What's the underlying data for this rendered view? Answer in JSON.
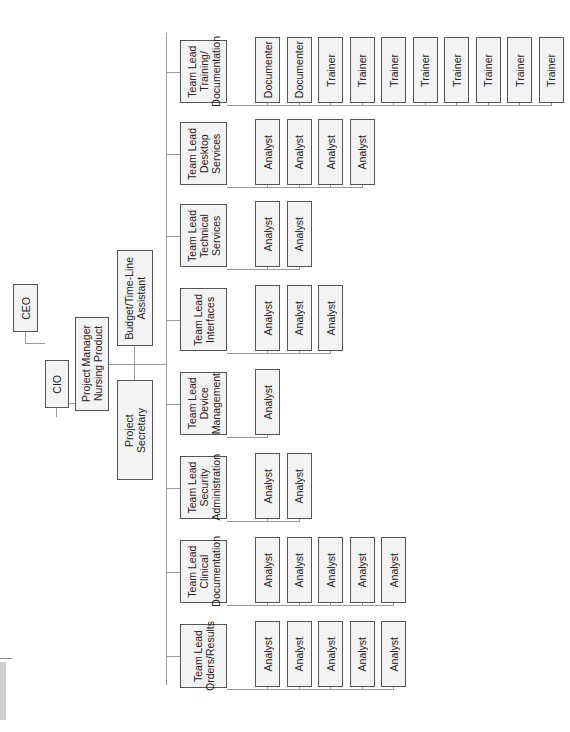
{
  "diagram": {
    "type": "org-chart",
    "orientation": "rotated-90-ccw",
    "executive": {
      "ceo": "CEO",
      "cio": "CIO",
      "project_manager": "Project Manager\nNursing Product"
    },
    "support_staff": {
      "secretary": "Project\nSecretary",
      "budget_assistant": "Budget/Time-Line\nAssistant"
    },
    "teams": [
      {
        "lead": "Team Lead\nOrders/Results",
        "members": [
          "Analyst",
          "Analyst",
          "Analyst",
          "Analyst",
          "Analyst"
        ]
      },
      {
        "lead": "Team Lead\nClinical\nDocumentation",
        "members": [
          "Analyst",
          "Analyst",
          "Analyst",
          "Analyst",
          "Analyst"
        ]
      },
      {
        "lead": "Team Lead\nSecurity\nAdministration",
        "members": [
          "Analyst",
          "Analyst"
        ]
      },
      {
        "lead": "Team Lead\nDevice\nManagement",
        "members": [
          "Analyst"
        ]
      },
      {
        "lead": "Team Lead\nInterfaces",
        "members": [
          "Analyst",
          "Analyst",
          "Analyst"
        ]
      },
      {
        "lead": "Team Lead\nTechnical\nServices",
        "members": [
          "Analyst",
          "Analyst"
        ]
      },
      {
        "lead": "Team Lead\nDesktop\nServices",
        "members": [
          "Analyst",
          "Analyst",
          "Analyst",
          "Analyst"
        ]
      },
      {
        "lead": "Team Lead\nTraining/\nDocumentation",
        "members": [
          "Documenter",
          "Documenter",
          "Trainer",
          "Trainer",
          "Trainer",
          "Trainer",
          "Trainer",
          "Trainer",
          "Trainer",
          "Trainer"
        ]
      }
    ]
  },
  "colors": {
    "box_fill": "#f3f3f3",
    "box_border": "#555555",
    "connector": "#9a9a9a",
    "background": "#ffffff"
  }
}
